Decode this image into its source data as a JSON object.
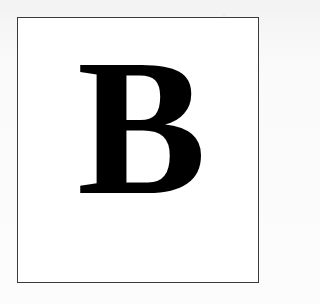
{
  "image": {
    "description": "Bold black serif capital letter inside a thin dark-bordered white frame",
    "letter": "B",
    "colors": {
      "background": "#f7f7f7",
      "frame_fill": "#ffffff",
      "frame_border": "#3a3a3a",
      "letter": "#000000"
    }
  }
}
